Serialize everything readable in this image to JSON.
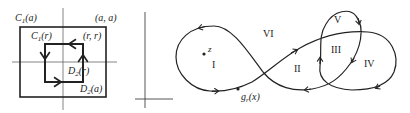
{
  "figure_left": {
    "labels": {
      "c1a": "C",
      "c1a_sub": "1",
      "c1a_arg": "(a)",
      "aa": "(a, a)",
      "c1r": "C",
      "c1r_sub": "1",
      "c1r_arg": "(r)",
      "rr": "(r, r)",
      "d2r": "D",
      "d2r_sub": "2",
      "d2r_arg": "(r)",
      "d2a": "D",
      "d2a_sub": "2",
      "d2a_arg": "(a)"
    }
  },
  "figure_middle": {
    "description": "empty coordinate axes"
  },
  "figure_right": {
    "labels": {
      "z": "z",
      "g": "g",
      "g_sub": "r",
      "g_arg": "(x)",
      "regions": [
        "I",
        "II",
        "III",
        "IV",
        "V",
        "VI"
      ]
    }
  },
  "colors": {
    "stroke": "#222222",
    "axis": "#555555",
    "background": "#ffffff"
  }
}
